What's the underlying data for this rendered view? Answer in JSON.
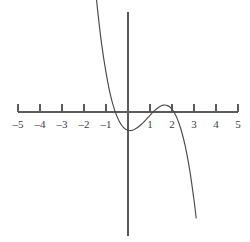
{
  "figure": {
    "title": "",
    "background_color": "#ffffff",
    "line_color": "#4a4a4a",
    "axis_color": "#5a5a5a",
    "label_color": "#3d3d3d"
  },
  "chart_data": {
    "type": "line",
    "title": "",
    "subtitle": "",
    "xlabel": "",
    "ylabel": "",
    "xlim": [
      -5.3,
      5.3
    ],
    "ylim": [
      -4.7,
      5.3
    ],
    "grid": false,
    "legend": null,
    "legend_position": "none",
    "x_ticks": [
      -5,
      -4,
      -3,
      -2,
      -1,
      1,
      2,
      3,
      4,
      5
    ],
    "x_tick_labels": [
      "–5",
      "–4",
      "–3",
      "–2",
      "–1",
      "1",
      "2",
      "3",
      "4",
      "5"
    ],
    "y_ticks": [],
    "y_tick_labels": [],
    "annotations": [],
    "series": [
      {
        "name": "cubic",
        "description": "Downward cubic with roots near x = -1, x = 1, x = 2",
        "roots": [
          -1,
          1,
          2
        ],
        "local_minimum": {
          "x": 0.15,
          "y": -1.3
        },
        "local_maximum": {
          "x": 1.6,
          "y": 0.4
        },
        "y_intercept": -1.25,
        "x": [
          -2.0,
          -1.8,
          -1.6,
          -1.4,
          -1.2,
          -1.0,
          -0.8,
          -0.6,
          -0.4,
          -0.2,
          0.0,
          0.2,
          0.4,
          0.6,
          0.8,
          1.0,
          1.2,
          1.4,
          1.6,
          1.8,
          2.0,
          2.2,
          2.4,
          2.6,
          2.8,
          3.0,
          3.1
        ],
        "y": [
          11.9,
          9.1,
          6.8,
          4.8,
          3.1,
          1.8,
          0.78,
          0.06,
          -0.42,
          -0.71,
          -0.83,
          -0.83,
          -0.73,
          -0.57,
          -0.37,
          -0.15,
          0.06,
          0.22,
          0.31,
          0.29,
          0.13,
          -0.21,
          -0.76,
          -1.54,
          -2.61,
          -4.0,
          -4.82
        ]
      }
    ]
  },
  "geometry": {
    "x_axis_y_px": 112,
    "y_axis_x_px": 128,
    "unit_px": 22,
    "tick_height_px": 8,
    "curve_top_entry_px": {
      "x": 86,
      "y": 8
    },
    "curve_bottom_exit_px": {
      "x": 197,
      "y": 236
    },
    "y_axis_top_px": 12,
    "y_axis_bottom_px": 236,
    "x_axis_left_px": 18,
    "x_axis_right_px": 238
  }
}
